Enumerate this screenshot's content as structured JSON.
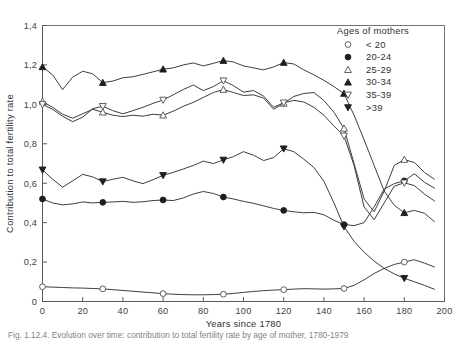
{
  "figure": {
    "caption": "Fig. 1.12.4. Evolution over time: contribution to total fertility rate by age of mother, 1780-1979"
  },
  "legend": {
    "title": "Ages of mothers",
    "position": "top-right",
    "entries": [
      {
        "label": "< 20",
        "marker": "open-circle"
      },
      {
        "label": "20-24",
        "marker": "filled-circle"
      },
      {
        "label": "25-29",
        "marker": "open-triangle-up"
      },
      {
        "label": "30-34",
        "marker": "filled-triangle-up"
      },
      {
        "label": "35-39",
        "marker": "open-triangle-down"
      },
      {
        "label": ">39",
        "marker": "filled-triangle-down"
      }
    ]
  },
  "chart_data": {
    "type": "line",
    "title": "",
    "xlabel": "Years since 1780",
    "ylabel": "Contribution to total fertility rate",
    "xlim": [
      0,
      200
    ],
    "ylim": [
      0,
      1.4
    ],
    "xticks": [
      0,
      20,
      40,
      60,
      80,
      100,
      120,
      140,
      160,
      180,
      200
    ],
    "xtick_labels": [
      "0",
      "20",
      "40",
      "60",
      "80",
      "100",
      "120",
      "140",
      "160",
      "180",
      "200"
    ],
    "yticks": [
      0,
      0.2,
      0.4,
      0.6,
      0.8,
      1.0,
      1.2,
      1.4
    ],
    "ytick_labels": [
      "0",
      "0,2",
      "0,4",
      "0,6",
      "0,8",
      "1,0",
      "1,2",
      "1,4"
    ],
    "grid": false,
    "decimal_separator": ",",
    "marker_interval_years": 30,
    "series": [
      {
        "name": "< 20",
        "marker": "open-circle",
        "x": [
          0,
          5,
          10,
          15,
          20,
          25,
          30,
          35,
          40,
          45,
          50,
          55,
          60,
          65,
          70,
          75,
          80,
          85,
          90,
          95,
          100,
          105,
          110,
          115,
          120,
          125,
          130,
          135,
          140,
          145,
          150,
          155,
          160,
          165,
          170,
          175,
          180,
          185,
          190,
          195
        ],
        "y": [
          0.075,
          0.073,
          0.071,
          0.069,
          0.068,
          0.066,
          0.064,
          0.06,
          0.056,
          0.052,
          0.048,
          0.044,
          0.04,
          0.037,
          0.035,
          0.034,
          0.034,
          0.035,
          0.037,
          0.041,
          0.046,
          0.051,
          0.055,
          0.058,
          0.06,
          0.063,
          0.065,
          0.064,
          0.063,
          0.064,
          0.066,
          0.082,
          0.11,
          0.142,
          0.168,
          0.188,
          0.2,
          0.212,
          0.195,
          0.175
        ]
      },
      {
        "name": "20-24",
        "marker": "filled-circle",
        "x": [
          0,
          5,
          10,
          15,
          20,
          25,
          30,
          35,
          40,
          45,
          50,
          55,
          60,
          65,
          70,
          75,
          80,
          85,
          90,
          95,
          100,
          105,
          110,
          115,
          120,
          125,
          130,
          135,
          140,
          145,
          150,
          155,
          160,
          165,
          170,
          175,
          180,
          185,
          190,
          195
        ],
        "y": [
          0.52,
          0.5,
          0.49,
          0.495,
          0.505,
          0.5,
          0.503,
          0.505,
          0.508,
          0.503,
          0.506,
          0.512,
          0.515,
          0.512,
          0.525,
          0.545,
          0.558,
          0.548,
          0.53,
          0.52,
          0.508,
          0.498,
          0.485,
          0.472,
          0.462,
          0.455,
          0.45,
          0.452,
          0.44,
          0.412,
          0.39,
          0.385,
          0.4,
          0.48,
          0.57,
          0.598,
          0.612,
          0.648,
          0.605,
          0.575
        ]
      },
      {
        "name": "25-29",
        "marker": "open-triangle-up",
        "x": [
          0,
          5,
          10,
          15,
          20,
          25,
          30,
          35,
          40,
          45,
          50,
          55,
          60,
          65,
          70,
          75,
          80,
          85,
          90,
          95,
          100,
          105,
          110,
          115,
          120,
          125,
          130,
          135,
          140,
          145,
          150,
          155,
          160,
          165,
          170,
          175,
          180,
          185,
          190,
          195
        ],
        "y": [
          1.015,
          0.985,
          0.95,
          0.93,
          0.952,
          0.975,
          0.96,
          0.945,
          0.938,
          0.945,
          0.94,
          0.95,
          0.945,
          0.965,
          0.99,
          1.01,
          1.035,
          1.06,
          1.075,
          1.06,
          1.045,
          1.048,
          1.032,
          0.975,
          1.005,
          1.04,
          1.055,
          1.06,
          1.02,
          0.96,
          0.878,
          0.7,
          0.52,
          0.455,
          0.56,
          0.69,
          0.72,
          0.705,
          0.655,
          0.62
        ]
      },
      {
        "name": "30-34",
        "marker": "filled-triangle-up",
        "x": [
          0,
          5,
          10,
          15,
          20,
          25,
          30,
          35,
          40,
          45,
          50,
          55,
          60,
          65,
          70,
          75,
          80,
          85,
          90,
          95,
          100,
          105,
          110,
          115,
          120,
          125,
          130,
          135,
          140,
          145,
          150,
          155,
          160,
          165,
          170,
          175,
          180,
          185,
          190,
          195
        ],
        "y": [
          1.19,
          1.15,
          1.075,
          1.138,
          1.168,
          1.155,
          1.11,
          1.118,
          1.135,
          1.14,
          1.152,
          1.165,
          1.178,
          1.185,
          1.2,
          1.21,
          1.195,
          1.208,
          1.222,
          1.215,
          1.195,
          1.185,
          1.175,
          1.19,
          1.212,
          1.205,
          1.175,
          1.15,
          1.122,
          1.09,
          1.055,
          0.945,
          0.82,
          0.69,
          0.56,
          0.488,
          0.45,
          0.462,
          0.448,
          0.405
        ]
      },
      {
        "name": "35-39",
        "marker": "open-triangle-down",
        "x": [
          0,
          5,
          10,
          15,
          20,
          25,
          30,
          35,
          40,
          45,
          50,
          55,
          60,
          65,
          70,
          75,
          80,
          85,
          90,
          95,
          100,
          105,
          110,
          115,
          120,
          125,
          130,
          135,
          140,
          145,
          150,
          155,
          160,
          165,
          170,
          175,
          180,
          185,
          190,
          195
        ],
        "y": [
          1.0,
          0.975,
          0.94,
          0.912,
          0.935,
          0.978,
          0.99,
          0.968,
          0.952,
          0.968,
          0.985,
          1.005,
          1.022,
          1.048,
          1.075,
          1.098,
          1.07,
          1.09,
          1.12,
          1.095,
          1.062,
          1.07,
          1.042,
          0.985,
          1.008,
          1.02,
          1.012,
          0.985,
          0.945,
          0.89,
          0.84,
          0.69,
          0.48,
          0.415,
          0.5,
          0.585,
          0.602,
          0.588,
          0.545,
          0.51
        ]
      },
      {
        "name": "> 39",
        "marker": "filled-triangle-down",
        "x": [
          0,
          5,
          10,
          15,
          20,
          25,
          30,
          35,
          40,
          45,
          50,
          55,
          60,
          65,
          70,
          75,
          80,
          85,
          90,
          95,
          100,
          105,
          110,
          115,
          120,
          125,
          130,
          135,
          140,
          145,
          150,
          155,
          160,
          165,
          170,
          175,
          180,
          185,
          190,
          195
        ],
        "y": [
          0.668,
          0.62,
          0.58,
          0.612,
          0.645,
          0.632,
          0.608,
          0.62,
          0.63,
          0.612,
          0.598,
          0.618,
          0.64,
          0.655,
          0.672,
          0.69,
          0.712,
          0.7,
          0.718,
          0.735,
          0.76,
          0.742,
          0.715,
          0.73,
          0.775,
          0.76,
          0.722,
          0.68,
          0.61,
          0.5,
          0.38,
          0.305,
          0.25,
          0.205,
          0.168,
          0.14,
          0.118,
          0.1,
          0.082,
          0.062
        ]
      }
    ]
  }
}
